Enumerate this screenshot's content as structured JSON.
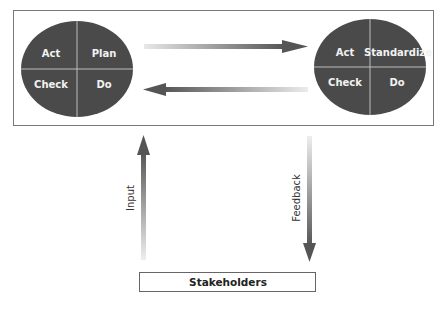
{
  "diagram": {
    "left_cycle": {
      "quadrants": {
        "top_left": "Act",
        "top_right": "Plan",
        "bottom_left": "Check",
        "bottom_right": "Do"
      }
    },
    "right_cycle": {
      "quadrants": {
        "top_left": "Act",
        "top_right": "Standardize",
        "bottom_left": "Check",
        "bottom_right": "Do"
      }
    },
    "arrows": {
      "input_label": "Input",
      "feedback_label": "Feedback"
    },
    "stakeholders_label": "Stakeholders",
    "colors": {
      "ellipse_fill": "#4a4a4a",
      "divider": "#bdbdbd",
      "arrow_dark": "#5a5a5a",
      "arrow_light": "#e6e6e6",
      "frame": "#777777"
    }
  }
}
